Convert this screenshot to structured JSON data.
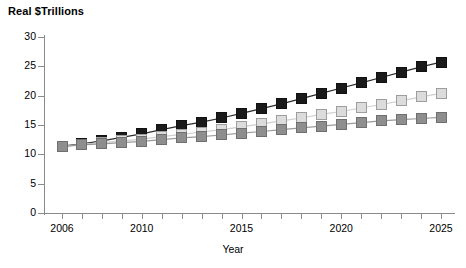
{
  "chart_data": {
    "type": "line",
    "title": "",
    "ylabel": "Real $Trillions",
    "xlabel": "Year",
    "ylim": [
      0,
      30
    ],
    "yticks": [
      0,
      5,
      10,
      15,
      20,
      25,
      30
    ],
    "xlim": [
      2006,
      2025
    ],
    "xticks": [
      2006,
      2007,
      2008,
      2009,
      2010,
      2011,
      2012,
      2013,
      2014,
      2015,
      2016,
      2017,
      2018,
      2019,
      2020,
      2021,
      2022,
      2023,
      2024,
      2025
    ],
    "xtick_labels_shown": [
      "2006",
      "2010",
      "2015",
      "2020",
      "2025"
    ],
    "grid": false,
    "legend": "none",
    "x": [
      2006,
      2007,
      2008,
      2009,
      2010,
      2011,
      2012,
      2013,
      2014,
      2015,
      2016,
      2017,
      2018,
      2019,
      2020,
      2021,
      2022,
      2023,
      2024,
      2025
    ],
    "categories": [
      "2006",
      "2007",
      "2008",
      "2009",
      "2010",
      "2011",
      "2012",
      "2013",
      "2014",
      "2015",
      "2016",
      "2017",
      "2018",
      "2019",
      "2020",
      "2021",
      "2022",
      "2023",
      "2024",
      "2025"
    ],
    "series": [
      {
        "name": "high",
        "marker": "filled-square",
        "color": "#1a1a1a",
        "values": [
          11.4,
          11.8,
          12.3,
          12.9,
          13.5,
          14.2,
          14.9,
          15.5,
          16.2,
          17.0,
          17.8,
          18.6,
          19.5,
          20.4,
          21.3,
          22.2,
          23.1,
          24.0,
          24.9,
          25.7
        ]
      },
      {
        "name": "middle",
        "marker": "light-square",
        "color": "#dcdcdc",
        "values": [
          11.3,
          11.7,
          12.0,
          12.3,
          12.6,
          13.0,
          13.4,
          13.8,
          14.2,
          14.7,
          15.2,
          15.7,
          16.2,
          16.8,
          17.3,
          17.9,
          18.5,
          19.1,
          19.8,
          20.4
        ]
      },
      {
        "name": "low",
        "marker": "gray-square",
        "color": "#8e8e8e",
        "values": [
          11.3,
          11.6,
          11.8,
          12.0,
          12.2,
          12.5,
          12.8,
          13.0,
          13.3,
          13.6,
          13.9,
          14.2,
          14.5,
          14.8,
          15.1,
          15.4,
          15.7,
          15.9,
          16.1,
          16.3
        ]
      }
    ]
  },
  "axes": {
    "y_title": "Real $Trillions",
    "x_title": "Year"
  }
}
